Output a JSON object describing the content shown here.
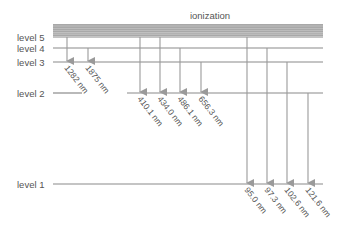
{
  "title": "ionization",
  "levels": [
    {
      "label": "level 5",
      "y": 37
    },
    {
      "label": "level 4",
      "y": 48
    },
    {
      "label": "level 3",
      "y": 62
    },
    {
      "label": "level 2",
      "y": 93
    },
    {
      "label": "level 1",
      "y": 184
    }
  ],
  "transitions": {
    "paschen": [
      {
        "wavelength": "1282 nm",
        "x": 67,
        "from_y": 37,
        "to_y": 62
      },
      {
        "wavelength": "1875 nm",
        "x": 88,
        "from_y": 48,
        "to_y": 62
      }
    ],
    "balmer": [
      {
        "wavelength": "410.1 nm",
        "x": 140,
        "from_y": 37,
        "to_y": 93
      },
      {
        "wavelength": "434.0 nm",
        "x": 160,
        "from_y": 37,
        "to_y": 93
      },
      {
        "wavelength": "486.1 nm",
        "x": 180,
        "from_y": 48,
        "to_y": 93
      },
      {
        "wavelength": "656.3 nm",
        "x": 201,
        "from_y": 62,
        "to_y": 93
      }
    ],
    "lyman": [
      {
        "wavelength": "95.0 nm",
        "x": 247,
        "from_y": 37,
        "to_y": 184
      },
      {
        "wavelength": "97.3 nm",
        "x": 267,
        "from_y": 48,
        "to_y": 184
      },
      {
        "wavelength": "102.6 nm",
        "x": 287,
        "from_y": 62,
        "to_y": 184
      },
      {
        "wavelength": "121.6 nm",
        "x": 308,
        "from_y": 93,
        "to_y": 184
      }
    ]
  },
  "colors": {
    "line": "#8a8a8a",
    "band": "#9a9a9a",
    "text": "#555555"
  }
}
